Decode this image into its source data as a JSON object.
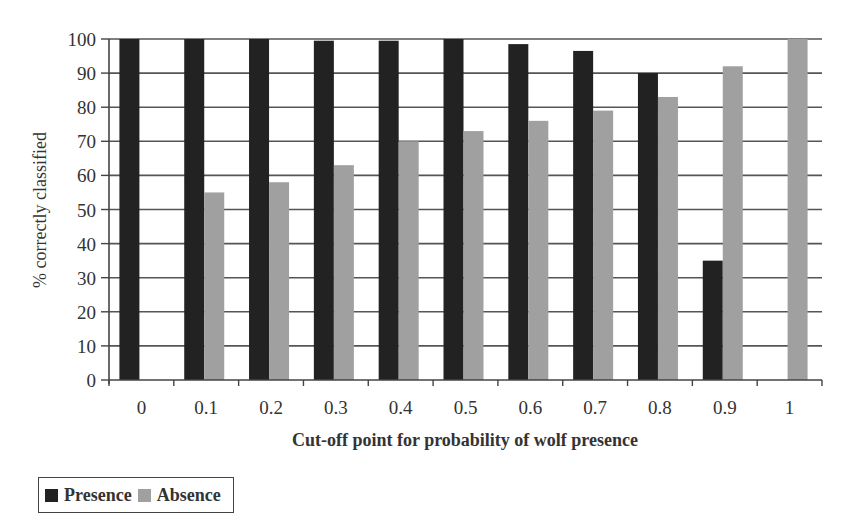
{
  "chart_data": {
    "type": "bar",
    "title": "",
    "xlabel": "Cut-off point for probability of wolf presence",
    "ylabel": "% correctly classified",
    "ylim": [
      0,
      100
    ],
    "yticks": [
      0,
      10,
      20,
      30,
      40,
      50,
      60,
      70,
      80,
      90,
      100
    ],
    "grid": true,
    "legend_position": "bottom-left",
    "categories": [
      "0",
      "0.1",
      "0.2",
      "0.3",
      "0.4",
      "0.5",
      "0.6",
      "0.7",
      "0.8",
      "0.9",
      "1"
    ],
    "series": [
      {
        "name": "Presence",
        "color": "#222222",
        "values": [
          100,
          100,
          100,
          99.5,
          99.5,
          100,
          98.5,
          96.5,
          90,
          35,
          0
        ]
      },
      {
        "name": "Absence",
        "color": "#a0a0a0",
        "values": [
          0,
          55,
          58,
          63,
          70,
          73,
          76,
          79,
          83,
          92,
          100
        ]
      }
    ]
  },
  "legend": {
    "items": [
      {
        "label": "Presence",
        "color": "#222222"
      },
      {
        "label": "Absence",
        "color": "#a0a0a0"
      }
    ]
  }
}
